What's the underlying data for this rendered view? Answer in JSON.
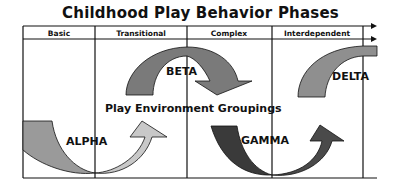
{
  "title": "Childhood Play Behavior Phases",
  "phases": [
    {
      "label": "Basic"
    },
    {
      "label": "Transitional"
    },
    {
      "label": "Complex"
    },
    {
      "label": "Interdependent"
    }
  ],
  "center_label": "Play Environment Groupings",
  "arrows": [
    {
      "label": "ALPHA",
      "color": "#9a9a9a",
      "head_color": "#c8c8c8"
    },
    {
      "label": "BETA",
      "color": "#7a7a7a"
    },
    {
      "label": "GAMMA",
      "color": "#3a3a3a"
    },
    {
      "label": "DELTA",
      "color": "#8f8f8f"
    }
  ]
}
